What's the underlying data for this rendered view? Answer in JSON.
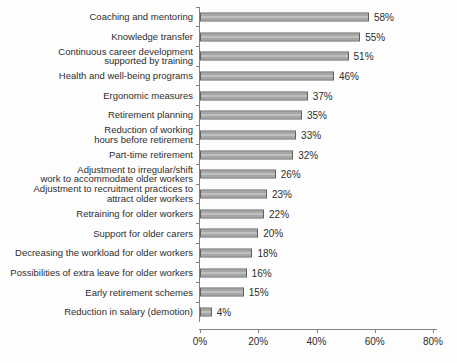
{
  "chart_data": {
    "type": "bar",
    "orientation": "horizontal",
    "title": "",
    "xlabel": "",
    "ylabel": "",
    "categories": [
      "Coaching and mentoring",
      "Knowledge transfer",
      "Continuous career development\nsupported by training",
      "Health and well-being programs",
      "Ergonomic measures",
      "Retirement planning",
      "Reduction of working\nhours before retirement",
      "Part-time retirement",
      "Adjustment to irregular/shift\nwork to accommodate older workers",
      "Adjustment to recruitment practices to\nattract older workers",
      "Retraining for older workers",
      "Support for older carers",
      "Decreasing the workload for older workers",
      "Possibilities of extra leave for older workers",
      "Early retirement schemes",
      "Reduction in salary (demotion)"
    ],
    "values": [
      58,
      55,
      51,
      46,
      37,
      35,
      33,
      32,
      26,
      23,
      22,
      20,
      18,
      16,
      15,
      4
    ],
    "value_labels": [
      "58%",
      "55%",
      "51%",
      "46%",
      "37%",
      "35%",
      "33%",
      "32%",
      "26%",
      "23%",
      "22%",
      "20%",
      "18%",
      "16%",
      "15%",
      "4%"
    ],
    "xlim": [
      0,
      80
    ],
    "x_tick_values": [
      0,
      20,
      40,
      60,
      80
    ],
    "x_tick_labels": [
      "0%",
      "20%",
      "40%",
      "60%",
      "80%"
    ],
    "grid": false,
    "legend": "none",
    "colors": {
      "bar_fill": "#a6a6a6",
      "bar_fill_light": "#c4c4c4",
      "bar_border": "#5f5f5f",
      "axis": "#808080",
      "text": "#2e2e2e",
      "background": "#fdfdfd"
    }
  }
}
